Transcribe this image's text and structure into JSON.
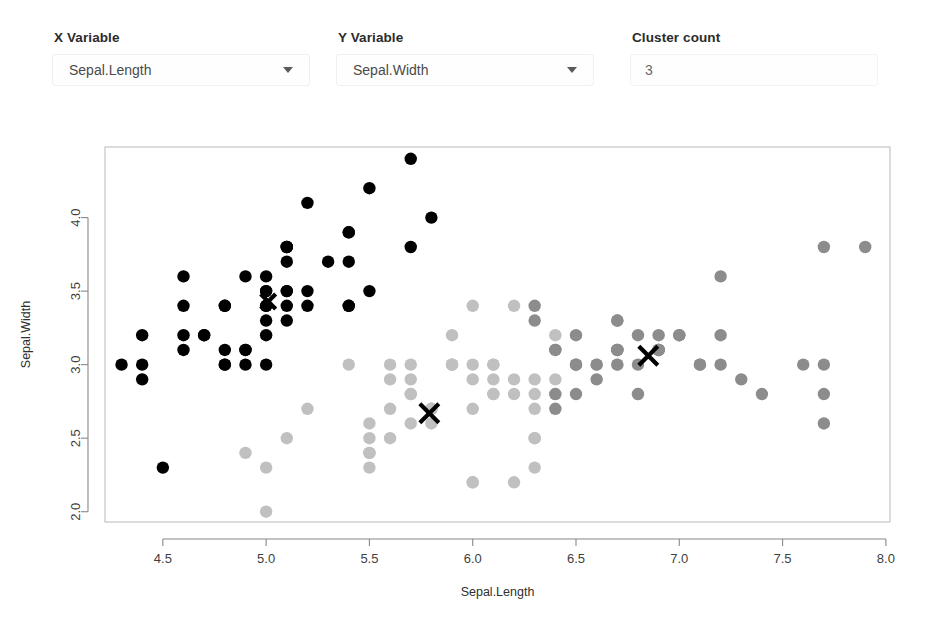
{
  "controls": {
    "x_variable": {
      "label": "X Variable",
      "value": "Sepal.Length",
      "caret_icon": "chevron-down-icon"
    },
    "y_variable": {
      "label": "Y Variable",
      "value": "Sepal.Width",
      "caret_icon": "chevron-down-icon"
    },
    "cluster_count": {
      "label": "Cluster count",
      "value": "3"
    }
  },
  "chart_data": {
    "type": "scatter",
    "title": "",
    "xlabel": "Sepal.Length",
    "ylabel": "Sepal.Width",
    "xlim": [
      4.22,
      8.02
    ],
    "ylim": [
      1.93,
      4.48
    ],
    "xticks": [
      "4.5",
      "5.0",
      "5.5",
      "6.0",
      "6.5",
      "7.0",
      "7.5",
      "8.0"
    ],
    "xtick_values": [
      4.5,
      5.0,
      5.5,
      6.0,
      6.5,
      7.0,
      7.5,
      8.0
    ],
    "yticks": [
      "2.0",
      "2.5",
      "3.0",
      "3.5",
      "4.0"
    ],
    "ytick_values": [
      2.0,
      2.5,
      3.0,
      3.5,
      4.0
    ],
    "grid": false,
    "legend": "none",
    "point_radius": 6.2,
    "colors": {
      "cluster1": "#000000",
      "cluster2": "#c0c0c0",
      "cluster3": "#8c8c8c",
      "centroid": "#000000"
    },
    "series": [
      {
        "name": "cluster1",
        "color": "#000000",
        "points": [
          [
            5.1,
            3.5
          ],
          [
            4.9,
            3.0
          ],
          [
            4.7,
            3.2
          ],
          [
            4.6,
            3.1
          ],
          [
            5.0,
            3.6
          ],
          [
            5.4,
            3.9
          ],
          [
            4.6,
            3.4
          ],
          [
            5.0,
            3.4
          ],
          [
            4.4,
            2.9
          ],
          [
            4.9,
            3.1
          ],
          [
            5.4,
            3.7
          ],
          [
            4.8,
            3.4
          ],
          [
            4.8,
            3.0
          ],
          [
            4.3,
            3.0
          ],
          [
            5.8,
            4.0
          ],
          [
            5.7,
            4.4
          ],
          [
            5.4,
            3.9
          ],
          [
            5.1,
            3.5
          ],
          [
            5.7,
            3.8
          ],
          [
            5.1,
            3.8
          ],
          [
            5.4,
            3.4
          ],
          [
            5.1,
            3.7
          ],
          [
            4.6,
            3.6
          ],
          [
            5.1,
            3.3
          ],
          [
            4.8,
            3.4
          ],
          [
            5.0,
            3.0
          ],
          [
            5.0,
            3.4
          ],
          [
            5.2,
            3.5
          ],
          [
            5.2,
            3.4
          ],
          [
            4.7,
            3.2
          ],
          [
            4.8,
            3.1
          ],
          [
            5.4,
            3.4
          ],
          [
            5.2,
            4.1
          ],
          [
            5.5,
            4.2
          ],
          [
            4.9,
            3.1
          ],
          [
            5.0,
            3.2
          ],
          [
            5.5,
            3.5
          ],
          [
            4.9,
            3.6
          ],
          [
            4.4,
            3.0
          ],
          [
            5.1,
            3.4
          ],
          [
            5.0,
            3.5
          ],
          [
            4.5,
            2.3
          ],
          [
            4.4,
            3.2
          ],
          [
            5.0,
            3.5
          ],
          [
            5.1,
            3.8
          ],
          [
            4.8,
            3.0
          ],
          [
            5.1,
            3.8
          ],
          [
            4.6,
            3.2
          ],
          [
            5.3,
            3.7
          ],
          [
            5.0,
            3.3
          ]
        ]
      },
      {
        "name": "cluster2",
        "color": "#c0c0c0",
        "points": [
          [
            5.5,
            2.3
          ],
          [
            5.7,
            2.8
          ],
          [
            4.9,
            2.4
          ],
          [
            5.2,
            2.7
          ],
          [
            5.0,
            2.0
          ],
          [
            5.9,
            3.0
          ],
          [
            6.0,
            2.2
          ],
          [
            6.1,
            2.9
          ],
          [
            5.6,
            2.9
          ],
          [
            5.8,
            2.7
          ],
          [
            6.2,
            2.2
          ],
          [
            5.6,
            2.5
          ],
          [
            5.9,
            3.2
          ],
          [
            6.1,
            2.8
          ],
          [
            6.3,
            2.5
          ],
          [
            6.1,
            2.8
          ],
          [
            6.4,
            2.9
          ],
          [
            6.6,
            3.0
          ],
          [
            6.8,
            2.8
          ],
          [
            6.7,
            3.0
          ],
          [
            6.0,
            2.9
          ],
          [
            5.7,
            2.6
          ],
          [
            5.5,
            2.4
          ],
          [
            5.5,
            2.4
          ],
          [
            5.8,
            2.7
          ],
          [
            6.0,
            2.7
          ],
          [
            5.4,
            3.0
          ],
          [
            6.0,
            3.4
          ],
          [
            6.7,
            3.1
          ],
          [
            6.3,
            2.3
          ],
          [
            5.6,
            3.0
          ],
          [
            5.5,
            2.5
          ],
          [
            5.5,
            2.6
          ],
          [
            6.1,
            3.0
          ],
          [
            5.8,
            2.6
          ],
          [
            5.0,
            2.3
          ],
          [
            5.6,
            2.7
          ],
          [
            5.7,
            3.0
          ],
          [
            5.7,
            2.9
          ],
          [
            6.2,
            2.9
          ],
          [
            5.1,
            2.5
          ],
          [
            5.7,
            2.8
          ],
          [
            5.8,
            2.7
          ],
          [
            6.0,
            3.0
          ],
          [
            6.3,
            2.7
          ],
          [
            6.2,
            2.8
          ],
          [
            6.1,
            3.0
          ],
          [
            6.3,
            2.5
          ],
          [
            5.9,
            3.0
          ],
          [
            6.0,
            2.2
          ],
          [
            6.3,
            2.8
          ],
          [
            6.4,
            2.8
          ],
          [
            6.2,
            3.4
          ],
          [
            5.9,
            3.0
          ],
          [
            6.3,
            2.9
          ],
          [
            6.5,
            3.0
          ],
          [
            6.4,
            3.2
          ]
        ]
      },
      {
        "name": "cluster3",
        "color": "#8c8c8c",
        "points": [
          [
            7.0,
            3.2
          ],
          [
            6.9,
            3.1
          ],
          [
            6.5,
            2.8
          ],
          [
            6.3,
            3.3
          ],
          [
            6.6,
            2.9
          ],
          [
            6.7,
            3.1
          ],
          [
            6.7,
            3.0
          ],
          [
            6.9,
            3.1
          ],
          [
            6.8,
            3.2
          ],
          [
            6.7,
            3.3
          ],
          [
            7.1,
            3.0
          ],
          [
            7.6,
            3.0
          ],
          [
            7.3,
            2.9
          ],
          [
            7.2,
            3.6
          ],
          [
            6.5,
            3.2
          ],
          [
            6.4,
            2.7
          ],
          [
            6.8,
            3.0
          ],
          [
            7.7,
            3.8
          ],
          [
            7.7,
            2.6
          ],
          [
            6.9,
            3.2
          ],
          [
            7.7,
            2.8
          ],
          [
            6.7,
            3.3
          ],
          [
            7.2,
            3.2
          ],
          [
            7.2,
            3.0
          ],
          [
            7.4,
            2.8
          ],
          [
            7.9,
            3.8
          ],
          [
            6.4,
            2.8
          ],
          [
            7.7,
            3.0
          ],
          [
            6.9,
            3.1
          ],
          [
            6.7,
            3.1
          ],
          [
            6.5,
            3.0
          ],
          [
            6.6,
            3.0
          ],
          [
            6.8,
            2.8
          ],
          [
            6.5,
            3.0
          ],
          [
            7.1,
            3.0
          ],
          [
            6.4,
            3.1
          ],
          [
            7.0,
            3.2
          ],
          [
            6.3,
            3.4
          ],
          [
            6.7,
            3.1
          ],
          [
            6.4,
            3.1
          ],
          [
            6.9,
            3.1
          ]
        ]
      }
    ],
    "centroids": [
      {
        "name": "centroid-cluster1",
        "x": 5.01,
        "y": 3.43,
        "size": 15
      },
      {
        "name": "centroid-cluster2",
        "x": 5.79,
        "y": 2.67,
        "size": 19
      },
      {
        "name": "centroid-cluster3",
        "x": 6.85,
        "y": 3.06,
        "size": 19
      }
    ]
  }
}
